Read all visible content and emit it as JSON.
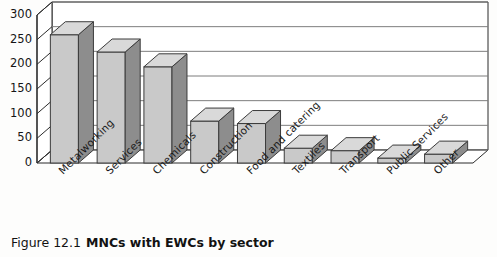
{
  "figure": {
    "number_label": "Figure 12.1",
    "title": "MNCs with EWCs by sector"
  },
  "chart_data": {
    "type": "bar",
    "title": "MNCs with EWCs by sector",
    "xlabel": "",
    "ylabel": "",
    "ylim": [
      0,
      300
    ],
    "yticks": [
      0,
      50,
      100,
      150,
      200,
      250,
      300
    ],
    "ytick_labels": [
      "0",
      "50",
      "100",
      "150",
      "200",
      "250",
      "300"
    ],
    "grid": true,
    "grid_axis": "y",
    "legend": false,
    "style": "3d-column",
    "categories": [
      "Metalworking",
      "Services",
      "Chemicals",
      "Construction",
      "Food and catering",
      "Textiles",
      "Transport",
      "Public Services",
      "Other"
    ],
    "values": [
      260,
      225,
      195,
      85,
      80,
      30,
      25,
      10,
      18
    ],
    "bar_fill": "#c9c9c9",
    "bar_side": "#8d8d8d",
    "bar_top": "#d9d9d9",
    "bar_edge": "#3b3b3b",
    "axis_color": "#2b2b2b",
    "grid_color": "#7d7d7d",
    "plot_background": "#ffffff"
  }
}
